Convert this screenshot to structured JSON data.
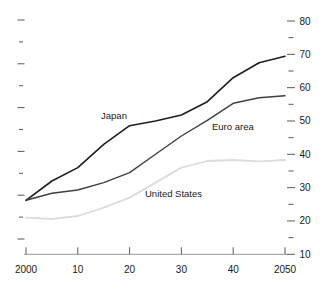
{
  "chart_data": {
    "type": "line",
    "title": "",
    "xlabel": "",
    "ylabel": "",
    "xlim": [
      2000,
      2050
    ],
    "ylim": [
      10,
      80
    ],
    "grid": false,
    "legend": "inline-labels",
    "x": [
      2000,
      2005,
      2010,
      2015,
      2020,
      2025,
      2030,
      2035,
      2040,
      2045,
      2050
    ],
    "series": [
      {
        "name": "Japan",
        "color": "#1f1f1f",
        "stroke_width": 1.6,
        "values": [
          26.2,
          32.0,
          36.0,
          43.0,
          48.6,
          50.0,
          51.8,
          55.8,
          63.0,
          67.5,
          69.4
        ]
      },
      {
        "name": "Euro area",
        "color": "#404040",
        "stroke_width": 1.4,
        "values": [
          26.2,
          28.3,
          29.3,
          31.5,
          34.5,
          40.0,
          45.5,
          50.2,
          55.3,
          57.0,
          57.6
        ]
      },
      {
        "name": "United States",
        "color": "#dcdcdc",
        "stroke_width": 1.8,
        "values": [
          21.0,
          20.6,
          21.5,
          24.0,
          27.0,
          31.5,
          36.0,
          38.0,
          38.3,
          37.9,
          38.3
        ]
      }
    ],
    "annotations": [
      {
        "text": "Japan",
        "px": 114,
        "py": 119,
        "anchor": "middle"
      },
      {
        "text": "Euro area",
        "px": 212,
        "py": 130,
        "anchor": "start"
      },
      {
        "text": "United States",
        "px": 145,
        "py": 197,
        "anchor": "start"
      }
    ],
    "x_axis": {
      "tick_years": [
        2000,
        2010,
        2020,
        2030,
        2040,
        2050
      ],
      "tick_labels": [
        "2000",
        "10",
        "20",
        "30",
        "40",
        "2050"
      ]
    },
    "y_axis_right": {
      "major_ticks": [
        10,
        20,
        30,
        40,
        50,
        60,
        70,
        80
      ],
      "major_labels": [
        "10",
        "20",
        "30",
        "40",
        "50",
        "60",
        "70",
        "80"
      ],
      "minor_ticks": [
        15,
        25,
        35,
        45,
        55,
        65,
        75
      ]
    },
    "y_axis_left": {
      "labels": [],
      "unlabeled_tick_count": 11
    },
    "colors": {
      "axis_line": "#999999",
      "tick_mark": "#5a5a5a",
      "tick_label": "#1a1a1a",
      "annotation_text": "#1a1a1a",
      "background": "#ffffff"
    }
  }
}
